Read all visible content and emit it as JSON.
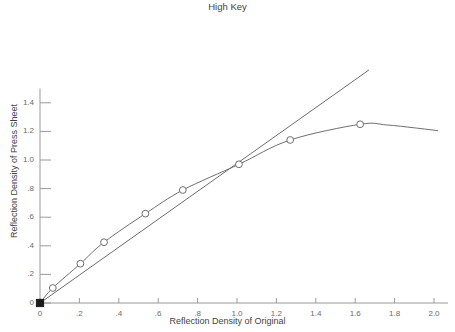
{
  "header": {
    "cut_text": ""
  },
  "chart_data": {
    "type": "line",
    "title": "High Key",
    "xlabel": "Reflection Density of Original",
    "ylabel": "Reflection Density of Press Sheet",
    "xlim": [
      0,
      2.0
    ],
    "ylim": [
      0,
      1.5
    ],
    "grid": false,
    "legend": "none",
    "xticks": [
      "0",
      ".2",
      ".4",
      ".6",
      ".8",
      "1.0",
      "1.2",
      "1.4",
      "1.6",
      "1.8",
      "2.0"
    ],
    "xtick_values": [
      0,
      0.2,
      0.4,
      0.6,
      0.8,
      1.0,
      1.2,
      1.4,
      1.6,
      1.8,
      2.0
    ],
    "yticks": [
      "0",
      ".2",
      ".4",
      ".6",
      ".8",
      "1.0",
      "1.2",
      "1.4"
    ],
    "ytick_values": [
      0,
      0.2,
      0.4,
      0.6,
      0.8,
      1.0,
      1.2,
      1.4
    ],
    "series": [
      {
        "name": "Tone Reproduction Curve",
        "marker": "open-circle",
        "color": "#6e6e6e",
        "x": [
          0.0,
          0.065,
          0.205,
          0.325,
          0.535,
          0.725,
          1.01,
          1.27,
          1.625
        ],
        "y": [
          0.0,
          0.105,
          0.275,
          0.425,
          0.625,
          0.79,
          0.97,
          1.14,
          1.25
        ]
      },
      {
        "name": "45 Degree Reference Line",
        "marker": "none",
        "color": "#6e6e6e",
        "x": [
          0.0,
          1.67
        ],
        "y": [
          0.0,
          1.63
        ]
      }
    ],
    "origin_marker": {
      "name": "filled-square",
      "x": 0.0,
      "y": 0.0,
      "color": "#1a1a1a"
    },
    "curve_tail": {
      "x": [
        1.625,
        1.76,
        1.9,
        2.02
      ],
      "y": [
        1.25,
        1.245,
        1.225,
        1.205
      ]
    }
  }
}
